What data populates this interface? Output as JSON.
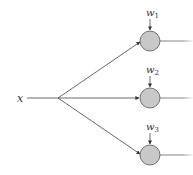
{
  "diagram": {
    "input_label": "x",
    "weights": [
      {
        "symbol": "w",
        "subscript": "1"
      },
      {
        "symbol": "w",
        "subscript": "2"
      },
      {
        "symbol": "w",
        "subscript": "3"
      }
    ],
    "node_count": 3,
    "colors": {
      "node_fill": "#c8c8c8",
      "node_stroke": "#555555",
      "line": "#444444",
      "text": "#333333"
    }
  }
}
